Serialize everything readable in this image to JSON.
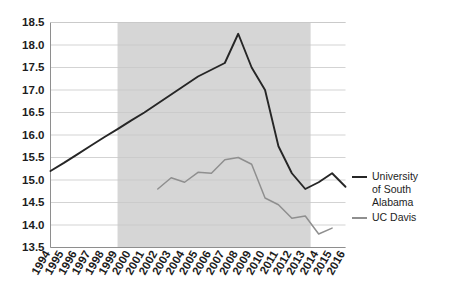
{
  "chart_data": {
    "type": "line",
    "title": "",
    "subtitle": "",
    "xlabel": "",
    "ylabel": "",
    "x": [
      1994,
      1995,
      1996,
      1997,
      1998,
      1999,
      2000,
      2001,
      2002,
      2003,
      2004,
      2005,
      2006,
      2007,
      2008,
      2009,
      2010,
      2011,
      2012,
      2013,
      2014,
      2015,
      2016
    ],
    "xlim": [
      1994,
      2016
    ],
    "ylim": [
      13.5,
      18.5
    ],
    "yticks": [
      13.5,
      14.0,
      14.5,
      15.0,
      15.5,
      16.0,
      16.5,
      17.0,
      17.5,
      18.0,
      18.5
    ],
    "ytick_labels": [
      "13.5",
      "14.0",
      "14.5",
      "15.0",
      "15.5",
      "16.0",
      "16.5",
      "17.0",
      "17.5",
      "18.0",
      "18.5"
    ],
    "xtick_labels": [
      "1994",
      "1995",
      "1996",
      "1997",
      "1998",
      "1999",
      "2000",
      "2001",
      "2002",
      "2003",
      "2004",
      "2005",
      "2006",
      "2007",
      "2008",
      "2009",
      "2010",
      "2011",
      "2012",
      "2013",
      "2014",
      "2015",
      "2016"
    ],
    "grid": "horizontal",
    "legend_position": "right",
    "series": [
      {
        "name": "University of South Alabama",
        "color": "#262626",
        "x": [
          1994,
          1995,
          1996,
          1997,
          1998,
          1999,
          2000,
          2001,
          2002,
          2003,
          2004,
          2005,
          2006,
          2007,
          2008,
          2009,
          2010,
          2011,
          2012,
          2013,
          2014,
          2015,
          2016
        ],
        "values": [
          15.2,
          15.38,
          15.57,
          15.76,
          15.95,
          16.13,
          16.32,
          16.5,
          16.7,
          16.9,
          17.1,
          17.3,
          17.45,
          17.6,
          18.25,
          17.5,
          17.0,
          15.75,
          15.15,
          14.8,
          14.95,
          15.15,
          14.85
        ]
      },
      {
        "name": "UC Davis",
        "color": "#8f8f8f",
        "x": [
          2002,
          2003,
          2004,
          2005,
          2006,
          2007,
          2008,
          2009,
          2010,
          2011,
          2012,
          2013,
          2014,
          2015
        ],
        "values": [
          14.8,
          15.05,
          14.95,
          15.17,
          15.15,
          15.45,
          15.5,
          15.35,
          14.6,
          14.45,
          14.15,
          14.2,
          13.8,
          13.93
        ]
      }
    ],
    "shaded_band": {
      "start": 1999.0,
      "end": 2013.4,
      "color": "#d6d6d6"
    }
  },
  "legend": {
    "entries": [
      {
        "label": "University of South Alabama",
        "color": "#262626"
      },
      {
        "label": "UC Davis",
        "color": "#8f8f8f"
      }
    ]
  }
}
